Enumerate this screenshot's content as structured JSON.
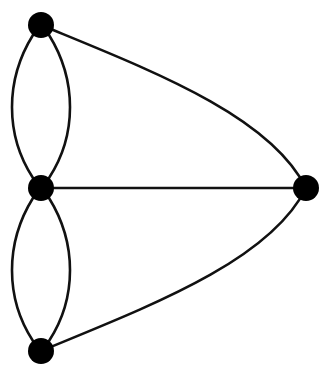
{
  "diagram": {
    "type": "multigraph",
    "colors": {
      "node": "#000000",
      "edge": "#111111",
      "background": "#ffffff"
    },
    "nodes": [
      {
        "id": "top",
        "x": 41,
        "y": 25,
        "r": 13
      },
      {
        "id": "middle",
        "x": 41,
        "y": 188,
        "r": 13
      },
      {
        "id": "right",
        "x": 306,
        "y": 188,
        "r": 13
      },
      {
        "id": "bottom",
        "x": 41,
        "y": 351,
        "r": 13
      }
    ],
    "edges": [
      {
        "from": "top",
        "to": "middle",
        "kind": "curve-left"
      },
      {
        "from": "top",
        "to": "middle",
        "kind": "curve-right"
      },
      {
        "from": "middle",
        "to": "bottom",
        "kind": "curve-left"
      },
      {
        "from": "middle",
        "to": "bottom",
        "kind": "curve-right"
      },
      {
        "from": "middle",
        "to": "right",
        "kind": "straight"
      },
      {
        "from": "top",
        "to": "right",
        "kind": "arc"
      },
      {
        "from": "bottom",
        "to": "right",
        "kind": "arc"
      }
    ]
  }
}
